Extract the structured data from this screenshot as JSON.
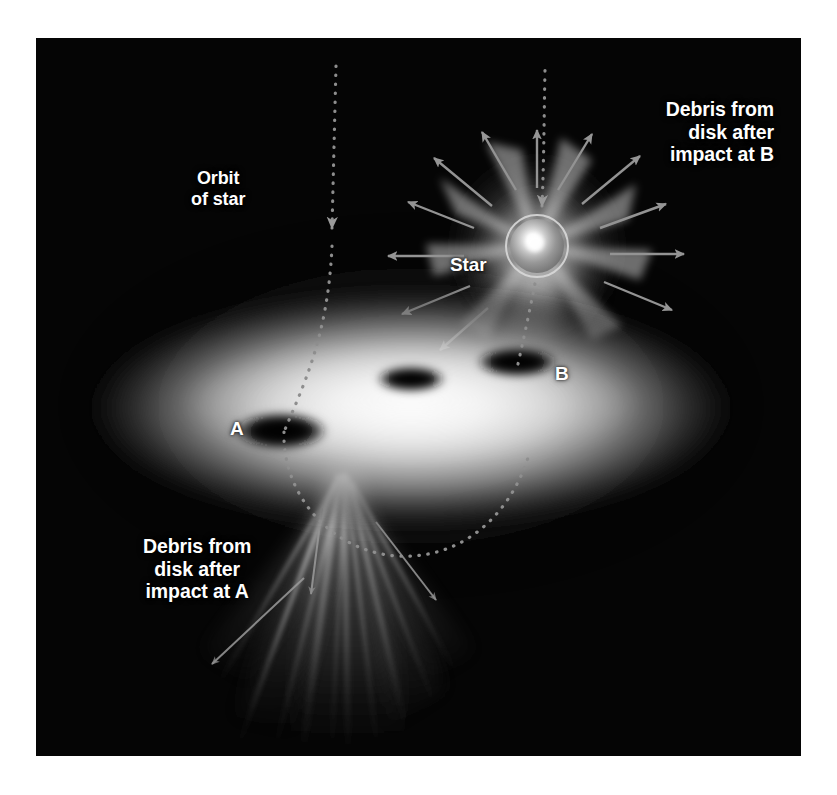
{
  "figure": {
    "kind": "astronomy-illustration",
    "caption_labels": {
      "debris_b": "Debris from\ndisk after\nimpact at B",
      "debris_a": "Debris from\ndisk after\nimpact at A",
      "orbit": "Orbit\nof star",
      "star": "Star",
      "impact_a": "A",
      "impact_b": "B"
    },
    "colors": {
      "background": "#ffffff",
      "panel": "#050505",
      "disk_bright": "#f2f2f2",
      "disk_mid": "#9a9a9a",
      "hole": "#000000",
      "star_core": "#ffffff",
      "star_ring": "#cfcfcf",
      "arrow": "#8f8f8f",
      "orbit_dots": "#8a8a8a",
      "label_text": "#ffffff",
      "plume": "#b4b4b4"
    },
    "elements": {
      "disk": {
        "name": "accretion-disk",
        "center_x": 375,
        "center_y": 370,
        "radius_x": 330,
        "radius_y": 118
      },
      "holes": [
        {
          "id": "A",
          "label": "A",
          "cx": 245,
          "cy": 393,
          "rx": 42,
          "ry": 17
        },
        {
          "id": "center",
          "label": "",
          "cx": 375,
          "cy": 341,
          "rx": 32,
          "ry": 12
        },
        {
          "id": "B",
          "label": "B",
          "cx": 480,
          "cy": 325,
          "rx": 38,
          "ry": 14
        }
      ],
      "star": {
        "cx": 501,
        "cy": 208,
        "radius": 27,
        "ring_radius": 31
      },
      "upper_burst": {
        "cx": 501,
        "cy": 210,
        "arrow_count": 12
      },
      "lower_plume": {
        "apex_x": 305,
        "apex_y": 452,
        "spread": 150,
        "streak_count": 11
      },
      "orbit_left": {
        "from_y": 30,
        "to_y": 400,
        "x": 300
      },
      "orbit_right": {
        "from_y": 28,
        "to_y": 325,
        "x": 508
      },
      "orbit_curve_below_disk": true
    }
  }
}
